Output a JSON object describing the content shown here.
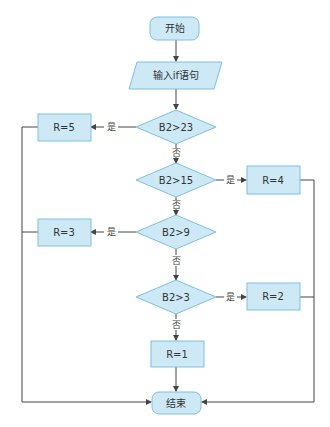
{
  "colors": {
    "node_fill": "#cde9f6",
    "node_stroke": "#7fc0de",
    "line": "#444444",
    "text": "#333333"
  },
  "nodes": {
    "start": {
      "label": "开始",
      "shape": "terminator"
    },
    "input": {
      "label": "输入if语句",
      "shape": "parallelogram"
    },
    "d1": {
      "label": "B2>23",
      "shape": "diamond"
    },
    "r5": {
      "label": "R=5",
      "shape": "process"
    },
    "d2": {
      "label": "B2>15",
      "shape": "diamond"
    },
    "r4": {
      "label": "R=4",
      "shape": "process"
    },
    "d3": {
      "label": "B2>9",
      "shape": "diamond"
    },
    "r3": {
      "label": "R=3",
      "shape": "process"
    },
    "d4": {
      "label": "B2>3",
      "shape": "diamond"
    },
    "r2": {
      "label": "R=2",
      "shape": "process"
    },
    "r1": {
      "label": "R=1",
      "shape": "process"
    },
    "end": {
      "label": "结束",
      "shape": "terminator"
    }
  },
  "edges": {
    "yes": "是",
    "no": "否"
  }
}
